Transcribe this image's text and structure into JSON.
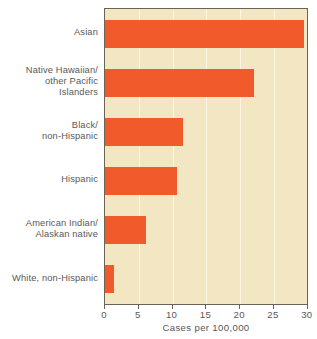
{
  "chart_data": {
    "type": "bar",
    "orientation": "horizontal",
    "title": "",
    "xlabel": "Cases per 100,000",
    "ylabel": "",
    "categories": [
      "Asian",
      "Native Hawaiian/\nother Pacific\nIslanders",
      "Black/\nnon-Hispanic",
      "Hispanic",
      "American Indian/\nAlaskan native",
      "White, non-Hispanic"
    ],
    "values": [
      29.4,
      22.0,
      11.6,
      10.6,
      6.1,
      1.4
    ],
    "xlim": [
      0,
      30
    ],
    "xticks": [
      0,
      5,
      10,
      15,
      20,
      25,
      30
    ],
    "xticklabels": [
      "0",
      "5",
      "10",
      "15",
      "20",
      "25",
      "30"
    ],
    "grid": "vertical",
    "legend": "none",
    "colors": {
      "bar": "#f15a2b",
      "plot_background": "#f2e7c2",
      "gridline": "#fbf6e4",
      "axis": "#6b6452",
      "text": "#58585a",
      "page_background": "#ffffff"
    }
  }
}
